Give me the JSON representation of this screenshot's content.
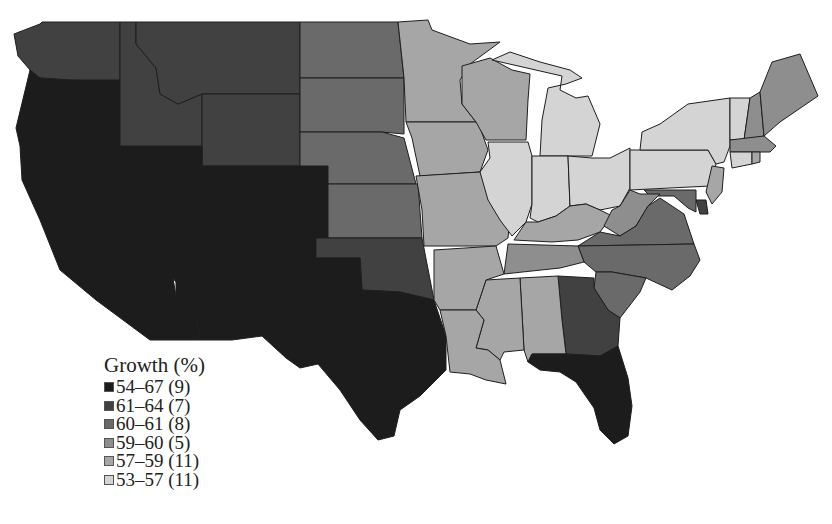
{
  "legend": {
    "title": "Growth (%)",
    "classes": [
      {
        "id": "c1",
        "range": "54–67",
        "count": "(9)",
        "color": "#1c1c1c"
      },
      {
        "id": "c2",
        "range": "61–64",
        "count": "(7)",
        "color": "#414141"
      },
      {
        "id": "c3",
        "range": "60–61",
        "count": "(8)",
        "color": "#6a6a6a"
      },
      {
        "id": "c4",
        "range": "59–60",
        "count": "(5)",
        "color": "#8e8e8e"
      },
      {
        "id": "c5",
        "range": "57–59",
        "count": "(11)",
        "color": "#a6a6a6"
      },
      {
        "id": "c6",
        "range": "53–57",
        "count": "(11)",
        "color": "#d4d4d4"
      }
    ]
  },
  "chart_data": {
    "type": "choropleth",
    "title": "Growth (%)",
    "region": "Contiguous United States",
    "legend_position": "lower-left",
    "classes": [
      {
        "label": "54–67",
        "count": 9
      },
      {
        "label": "61–64",
        "count": 7
      },
      {
        "label": "60–61",
        "count": 8
      },
      {
        "label": "59–60",
        "count": 5
      },
      {
        "label": "57–59",
        "count": 11
      },
      {
        "label": "53–57",
        "count": 11
      }
    ],
    "states": {
      "CA": "c1",
      "OR": "c1",
      "NV": "c1",
      "UT": "c1",
      "AZ": "c1",
      "NM": "c1",
      "CO": "c1",
      "TX": "c1",
      "FL": "c1",
      "WA": "c2",
      "ID": "c2",
      "MT": "c2",
      "WY": "c2",
      "OK": "c2",
      "GA": "c2",
      "DE": "c2",
      "ND": "c3",
      "SD": "c3",
      "NE": "c3",
      "KS": "c3",
      "NC": "c3",
      "SC": "c3",
      "VA": "c3",
      "MD": "c3",
      "NH": "c4",
      "ME": "c4",
      "WV": "c4",
      "MA": "c4",
      "TN": "c4",
      "MN": "c5",
      "WI": "c5",
      "IA": "c5",
      "MO": "c5",
      "AR": "c5",
      "LA": "c5",
      "MS": "c5",
      "AL": "c5",
      "NJ": "c5",
      "RI": "c5",
      "KY": "c5",
      "MI": "c6",
      "IL": "c6",
      "IN": "c6",
      "OH": "c6",
      "PA": "c6",
      "NY": "c6",
      "VT": "c6",
      "CT": "c6"
    }
  }
}
